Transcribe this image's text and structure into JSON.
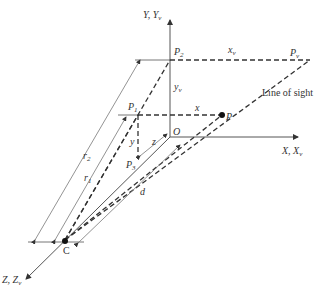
{
  "diagram": {
    "type": "perspective-projection-geometry",
    "axes": {
      "y": {
        "label": "Y, Y",
        "sub": "v"
      },
      "x": {
        "label": "X, X",
        "sub": "v"
      },
      "z": {
        "label": "Z, Z",
        "sub": "v"
      }
    },
    "points": {
      "P2": {
        "label": "P",
        "sub": "2"
      },
      "Pv": {
        "label": "P",
        "sub": "v"
      },
      "P1": {
        "label": "P",
        "sub": "1"
      },
      "P": {
        "label": "P"
      },
      "P3": {
        "label": "P",
        "sub": "3"
      },
      "O": {
        "label": "O"
      },
      "C": {
        "label": "C"
      }
    },
    "dimensions": {
      "xv": {
        "label": "x",
        "sub": "v"
      },
      "yv": {
        "label": "y",
        "sub": "v"
      },
      "x": {
        "label": "x"
      },
      "y": {
        "label": "y"
      },
      "z": {
        "label": "z"
      },
      "r1": {
        "label": "r",
        "sub": "1"
      },
      "r2": {
        "label": "r",
        "sub": "2"
      },
      "d": {
        "label": "d"
      }
    },
    "annotations": {
      "line_of_sight": "Line of sight"
    }
  }
}
